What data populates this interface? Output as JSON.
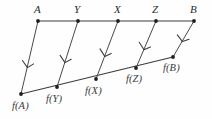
{
  "figure": {
    "background_color": "#fefefe",
    "line_color": "#3c3c3c",
    "point_color": "#1e1e1e",
    "label_color": "#2b2b2b",
    "domain_segment": {
      "name": "top-segment",
      "start": {
        "x": 38,
        "y": 21
      },
      "end": {
        "x": 194,
        "y": 21
      },
      "points": [
        {
          "id": "A",
          "label": "A",
          "x": 38,
          "y": 21,
          "label_x": 34,
          "label_y": 4
        },
        {
          "id": "Y",
          "label": "Y",
          "x": 78,
          "y": 21,
          "label_x": 74,
          "label_y": 4
        },
        {
          "id": "X",
          "label": "X",
          "x": 118,
          "y": 21,
          "label_x": 114,
          "label_y": 4
        },
        {
          "id": "Z",
          "label": "Z",
          "x": 156,
          "y": 21,
          "label_x": 152,
          "label_y": 4
        },
        {
          "id": "B",
          "label": "B",
          "x": 194,
          "y": 21,
          "label_x": 190,
          "label_y": 4
        }
      ]
    },
    "codomain_segment": {
      "name": "bottom-segment",
      "start": {
        "x": 21,
        "y": 94
      },
      "end": {
        "x": 173,
        "y": 57
      },
      "points": [
        {
          "id": "fA",
          "label": "f(A)",
          "x": 21,
          "y": 94,
          "label_x": 14,
          "label_y": 101
        },
        {
          "id": "fY",
          "label": "f(Y)",
          "x": 57,
          "y": 87,
          "label_x": 48,
          "label_y": 94
        },
        {
          "id": "fX",
          "label": "f(X)",
          "x": 96,
          "y": 79,
          "label_x": 86,
          "label_y": 86
        },
        {
          "id": "fZ",
          "label": "f(Z)",
          "x": 136,
          "y": 68,
          "label_x": 127,
          "label_y": 74
        },
        {
          "id": "fB",
          "label": "f(B)",
          "x": 173,
          "y": 57,
          "label_x": 164,
          "label_y": 63
        }
      ]
    },
    "mapping_arrows": [
      {
        "id": "arrow-A",
        "from": "A",
        "to": "fA",
        "x1": 38,
        "y1": 21,
        "x2": 21,
        "y2": 94
      },
      {
        "id": "arrow-Y",
        "from": "Y",
        "to": "fY",
        "x1": 78,
        "y1": 21,
        "x2": 57,
        "y2": 87
      },
      {
        "id": "arrow-X",
        "from": "X",
        "to": "fX",
        "x1": 118,
        "y1": 21,
        "x2": 96,
        "y2": 79
      },
      {
        "id": "arrow-Z",
        "from": "Z",
        "to": "fZ",
        "x1": 156,
        "y1": 21,
        "x2": 136,
        "y2": 68
      },
      {
        "id": "arrow-B",
        "from": "B",
        "to": "fB",
        "x1": 194,
        "y1": 21,
        "x2": 173,
        "y2": 57
      }
    ]
  }
}
